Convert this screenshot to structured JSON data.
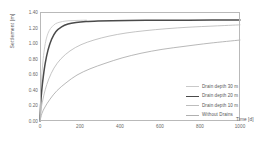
{
  "chart_data": {
    "type": "line",
    "title": "",
    "xlabel": "Time [d]",
    "ylabel": "Settlement [m]",
    "xlim": [
      0,
      1000
    ],
    "ylim": [
      0,
      1.4
    ],
    "xticks": [
      0,
      200,
      400,
      600,
      800,
      1000
    ],
    "xtick_labels": [
      "0",
      "200",
      "400",
      "600",
      "800",
      "1000"
    ],
    "yticks": [
      0.0,
      0.2,
      0.4,
      0.6,
      0.8,
      1.0,
      1.2,
      1.4
    ],
    "ytick_labels": [
      "0.00",
      "0.20",
      "0.40",
      "0.60",
      "0.80",
      "1.00",
      "1.20",
      "1.40"
    ],
    "grid": false,
    "legend_position": "lower right",
    "series": [
      {
        "name": "Drain depth 30 m",
        "color": "#c9c9c9",
        "width": 0.9,
        "x": [
          0,
          3,
          6,
          10,
          16,
          24,
          34,
          46,
          60,
          78,
          100,
          125,
          155,
          185,
          215,
          232
        ],
        "y": [
          0.0,
          0.3,
          0.46,
          0.63,
          0.8,
          0.96,
          1.08,
          1.16,
          1.21,
          1.25,
          1.27,
          1.283,
          1.289,
          1.292,
          1.294,
          1.295
        ]
      },
      {
        "name": "Drain depth 20 m",
        "color": "#4a4a4a",
        "width": 1.5,
        "x": [
          0,
          4,
          9,
          16,
          26,
          40,
          58,
          80,
          108,
          140,
          180,
          230,
          290,
          360,
          440,
          530,
          630,
          740,
          860,
          1000
        ],
        "y": [
          0.0,
          0.24,
          0.4,
          0.56,
          0.74,
          0.91,
          1.05,
          1.15,
          1.21,
          1.245,
          1.265,
          1.278,
          1.285,
          1.289,
          1.291,
          1.293,
          1.294,
          1.295,
          1.296,
          1.297
        ]
      },
      {
        "name": "Drain depth 10 m",
        "color": "#bdbdbd",
        "width": 0.9,
        "x": [
          0,
          6,
          14,
          26,
          44,
          70,
          105,
          150,
          205,
          270,
          345,
          430,
          525,
          630,
          745,
          870,
          1000
        ],
        "y": [
          0.0,
          0.16,
          0.27,
          0.4,
          0.54,
          0.68,
          0.8,
          0.9,
          0.98,
          1.04,
          1.09,
          1.13,
          1.16,
          1.185,
          1.205,
          1.22,
          1.235
        ]
      },
      {
        "name": "Without Drains",
        "color": "#b0b0b0",
        "width": 0.9,
        "x": [
          0,
          10,
          25,
          50,
          85,
          130,
          185,
          250,
          325,
          410,
          505,
          610,
          725,
          850,
          1000
        ],
        "y": [
          0.0,
          0.1,
          0.18,
          0.28,
          0.39,
          0.49,
          0.59,
          0.67,
          0.74,
          0.81,
          0.87,
          0.92,
          0.96,
          1.0,
          1.04
        ]
      }
    ]
  },
  "legend": {
    "items": [
      {
        "label": "Drain depth 30 m",
        "color": "#c9c9c9",
        "width": 0.9
      },
      {
        "label": "Drain depth 20 m",
        "color": "#4a4a4a",
        "width": 1.6
      },
      {
        "label": "Drain depth 10 m",
        "color": "#bdbdbd",
        "width": 0.9
      },
      {
        "label": "Without Drains",
        "color": "#b0b0b0",
        "width": 0.9
      }
    ]
  },
  "axes": {
    "frame_color": "#b9b9b9"
  }
}
